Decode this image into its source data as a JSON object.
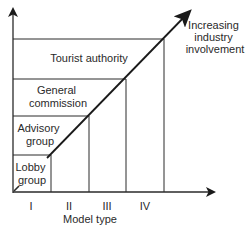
{
  "diagram": {
    "arrow_label": [
      "Increasing",
      "industry",
      "involvement"
    ],
    "x_axis_label": "Model type",
    "x_ticks": [
      "I",
      "II",
      "III",
      "IV"
    ],
    "steps": [
      {
        "model": "I",
        "label": [
          "Lobby",
          "group"
        ]
      },
      {
        "model": "II",
        "label": [
          "Advisory",
          "group"
        ]
      },
      {
        "model": "III",
        "label": [
          "General",
          "commission"
        ]
      },
      {
        "model": "IV",
        "label": [
          "Tourist authority"
        ]
      }
    ],
    "colors": {
      "line": "#2a2a2a",
      "background": "#ffffff"
    }
  }
}
